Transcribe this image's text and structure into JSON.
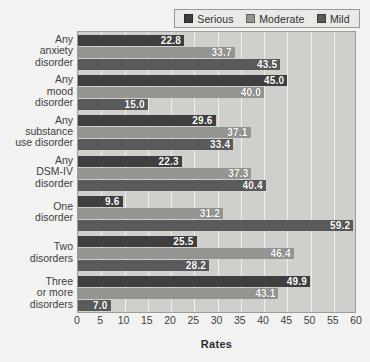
{
  "legend": {
    "items": [
      {
        "label": "Serious",
        "color": "#3f3f3f",
        "icon": "legend-swatch-icon"
      },
      {
        "label": "Moderate",
        "color": "#949490",
        "icon": "legend-swatch-icon"
      },
      {
        "label": "Mild",
        "color": "#5a5a5a",
        "icon": "legend-swatch-icon"
      }
    ]
  },
  "axis": {
    "x_title": "Rates",
    "x_ticks": [
      "0",
      "5",
      "10",
      "15",
      "20",
      "25",
      "30",
      "35",
      "40",
      "45",
      "50",
      "55",
      "60"
    ]
  },
  "categories_display": [
    [
      "Any",
      "anxiety",
      "disorder"
    ],
    [
      "Any",
      "mood",
      "disorder"
    ],
    [
      "Any",
      "substance",
      "use disorder"
    ],
    [
      "Any",
      "DSM-IV",
      "disorder"
    ],
    [
      "One",
      "disorder"
    ],
    [
      "Two",
      "disorders"
    ],
    [
      "Three",
      "or more",
      "disorders"
    ]
  ],
  "chart_data": {
    "type": "bar",
    "orientation": "horizontal",
    "title": "",
    "xlabel": "Rates",
    "ylabel": "",
    "xlim": [
      0,
      60
    ],
    "xticks": [
      0,
      5,
      10,
      15,
      20,
      25,
      30,
      35,
      40,
      45,
      50,
      55,
      60
    ],
    "grid": true,
    "legend_position": "top-right",
    "categories": [
      "Any anxiety disorder",
      "Any mood disorder",
      "Any substance use disorder",
      "Any DSM-IV disorder",
      "One disorder",
      "Two disorders",
      "Three or more disorders"
    ],
    "series": [
      {
        "name": "Serious",
        "color": "#3f3f3f",
        "values": [
          22.8,
          45.0,
          29.6,
          22.3,
          9.6,
          25.5,
          49.9
        ]
      },
      {
        "name": "Moderate",
        "color": "#949490",
        "values": [
          33.7,
          40.0,
          37.1,
          37.3,
          31.2,
          46.4,
          43.1
        ]
      },
      {
        "name": "Mild",
        "color": "#5a5a5a",
        "values": [
          43.5,
          15.0,
          33.4,
          40.4,
          59.2,
          28.2,
          7.0
        ]
      }
    ],
    "data_labels": [
      [
        "22.8",
        "33.7",
        "43.5"
      ],
      [
        "45.0",
        "40.0",
        "15.0"
      ],
      [
        "29.6",
        "37.1",
        "33.4"
      ],
      [
        "22.3",
        "37.3",
        "40.4"
      ],
      [
        "9.6",
        "31.2",
        "59.2"
      ],
      [
        "25.5",
        "46.4",
        "28.2"
      ],
      [
        "49.9",
        "43.1",
        "7.0"
      ]
    ]
  }
}
